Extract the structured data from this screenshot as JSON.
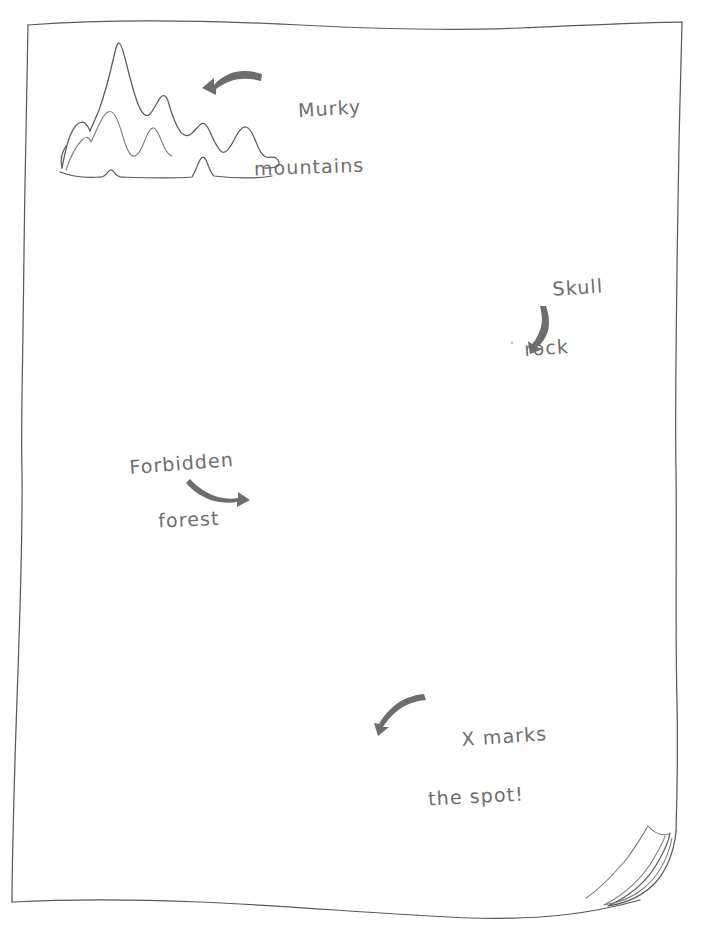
{
  "scene": {
    "kind": "hand-drawn-treasure-map",
    "paper_color": "#ffffff",
    "ink_color": "#5a5a5a",
    "text_color": "#6e6e6e",
    "arrow_color": "#6d6d6d",
    "background_color": "#ffffff"
  },
  "annotations": {
    "murky": {
      "line1": "Murky",
      "line2": "mountains",
      "arrow_direction": "left"
    },
    "skull": {
      "line1": "Skull",
      "line2": "rock",
      "arrow_direction": "down"
    },
    "forest": {
      "line1": "Forbidden",
      "line2": "forest",
      "arrow_direction": "right"
    },
    "xmarks": {
      "line1": "X marks",
      "line2": "the spot!",
      "arrow_direction": "down-left"
    }
  },
  "drawings": {
    "mountains": "mountain-range-sketch",
    "page_curl": "curled-corner-bottom-right"
  }
}
